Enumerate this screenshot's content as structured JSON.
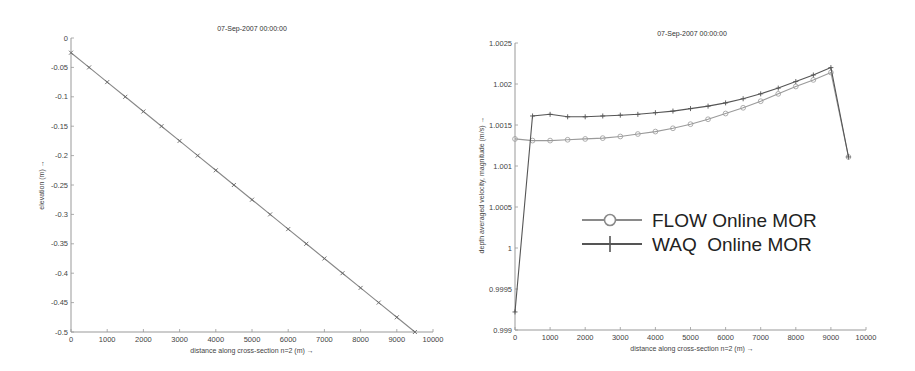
{
  "chart_data": [
    {
      "type": "line",
      "title": "07-Sep-2007 00:00:00",
      "xlabel": "distance along cross-section n=2 (m) →",
      "ylabel": "elevation (m) →",
      "xlim": [
        0,
        10000
      ],
      "ylim": [
        -0.5,
        0
      ],
      "xticks": [
        0,
        1000,
        2000,
        3000,
        4000,
        5000,
        6000,
        7000,
        8000,
        9000,
        10000
      ],
      "yticks": [
        0,
        -0.05,
        -0.1,
        -0.15,
        -0.2,
        -0.25,
        -0.3,
        -0.35,
        -0.4,
        -0.45,
        -0.5
      ],
      "grid": false,
      "series": [
        {
          "name": "elevation",
          "marker": "x",
          "color": "#888888",
          "x": [
            0,
            500,
            1000,
            1500,
            2000,
            2500,
            3000,
            3500,
            4000,
            4500,
            5000,
            5500,
            6000,
            6500,
            7000,
            7500,
            8000,
            8500,
            9000,
            9500
          ],
          "y": [
            -0.025,
            -0.05,
            -0.075,
            -0.1,
            -0.125,
            -0.15,
            -0.175,
            -0.2,
            -0.225,
            -0.25,
            -0.275,
            -0.3,
            -0.325,
            -0.35,
            -0.375,
            -0.4,
            -0.425,
            -0.45,
            -0.475,
            -0.5
          ]
        }
      ]
    },
    {
      "type": "line",
      "title": "07-Sep-2007 00:00:00",
      "xlabel": "distance along cross-section n=2 (m) →",
      "ylabel": "depth averaged velocity, magnitude (m/s) →",
      "xlim": [
        0,
        10000
      ],
      "ylim": [
        0.999,
        1.0025
      ],
      "xticks": [
        0,
        1000,
        2000,
        3000,
        4000,
        5000,
        6000,
        7000,
        8000,
        9000,
        10000
      ],
      "yticks": [
        0.999,
        0.9995,
        1,
        1.0005,
        1.001,
        1.0015,
        1.002,
        1.0025
      ],
      "grid": false,
      "legend_position": "center-right (inside)",
      "series": [
        {
          "name": "FLOW Online MOR",
          "marker": "o",
          "color": "#9a9a9a",
          "x": [
            0,
            500,
            1000,
            1500,
            2000,
            2500,
            3000,
            3500,
            4000,
            4500,
            5000,
            5500,
            6000,
            6500,
            7000,
            7500,
            8000,
            8500,
            9000,
            9500
          ],
          "y": [
            1.00133,
            1.00131,
            1.00131,
            1.00132,
            1.00133,
            1.00134,
            1.00136,
            1.00139,
            1.00142,
            1.00146,
            1.00151,
            1.00157,
            1.00164,
            1.00171,
            1.00179,
            1.00188,
            1.00197,
            1.00205,
            1.00214,
            1.00111
          ]
        },
        {
          "name": "WAQ  Online MOR",
          "marker": "+",
          "color": "#555555",
          "x": [
            0,
            500,
            1000,
            1500,
            2000,
            2500,
            3000,
            3500,
            4000,
            4500,
            5000,
            5500,
            6000,
            6500,
            7000,
            7500,
            8000,
            8500,
            9000,
            9500
          ],
          "y": [
            0.99922,
            1.00161,
            1.00163,
            1.0016,
            1.0016,
            1.00161,
            1.00162,
            1.00163,
            1.00165,
            1.00167,
            1.0017,
            1.00173,
            1.00177,
            1.00182,
            1.00188,
            1.00195,
            1.00203,
            1.00211,
            1.0022,
            1.00111
          ]
        }
      ]
    }
  ],
  "legend": {
    "items": [
      {
        "label": "FLOW Online MOR",
        "marker": "circle"
      },
      {
        "label": "WAQ  Online MOR",
        "marker": "plus"
      }
    ]
  }
}
